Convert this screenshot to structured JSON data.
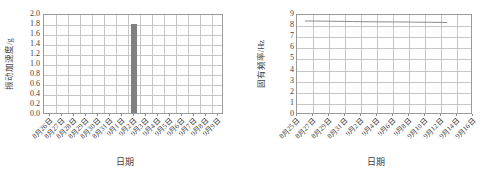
{
  "figure": {
    "background_color": "#ffffff",
    "text_color": "#3f3f3f",
    "grid_color": "#c6c6c6",
    "frame_color": "#9a9a9a"
  },
  "chart_data": [
    {
      "id": "vibration-acceleration-chart",
      "type": "bar",
      "title": "",
      "xlabel": "日期",
      "ylabel": "振动加速度/g",
      "categories": [
        "8月26日",
        "8月27日",
        "8月28日",
        "8月29日",
        "8月30日",
        "8月31日",
        "9月1日",
        "9月2日",
        "9月3日",
        "9月4日",
        "9月5日",
        "9月6日",
        "9月7日",
        "9月8日",
        "9月9日"
      ],
      "values": [
        0,
        0,
        0,
        0,
        0,
        0,
        0,
        1.79,
        0,
        0,
        0,
        0,
        0,
        0,
        0
      ],
      "ylim": [
        0.0,
        2.0
      ],
      "yticks": [
        "0.0",
        "0.2",
        "0.4",
        "0.6",
        "0.8",
        "1.0",
        "1.2",
        "1.4",
        "1.6",
        "1.8",
        "2.0"
      ],
      "ytick_values": [
        0.0,
        0.2,
        0.4,
        0.6,
        0.8,
        1.0,
        1.2,
        1.4,
        1.6,
        1.8,
        2.0
      ],
      "bar_color": "#808080",
      "grid": true,
      "legend": "none"
    },
    {
      "id": "natural-frequency-chart",
      "type": "line",
      "title": "",
      "xlabel": "日期",
      "ylabel": "固有频率/Hz",
      "categories": [
        "8月25日",
        "8月27日",
        "8月29日",
        "8月31日",
        "9月2日",
        "9月4日",
        "9月6日",
        "9月8日",
        "9月10日",
        "9月12日",
        "9月14日",
        "9月16日"
      ],
      "x": [
        0.5,
        1.5,
        2.5,
        3.5,
        4.5,
        5.5,
        6.5,
        7.5,
        8.5,
        9.5
      ],
      "values": [
        8.45,
        8.44,
        8.42,
        8.4,
        8.38,
        8.37,
        8.36,
        8.34,
        8.33,
        8.31
      ],
      "ylim": [
        0,
        9
      ],
      "yticks": [
        "0",
        "1",
        "2",
        "3",
        "4",
        "5",
        "6",
        "7",
        "8",
        "9"
      ],
      "ytick_values": [
        0,
        1,
        2,
        3,
        4,
        5,
        6,
        7,
        8,
        9
      ],
      "line_color": "#8c8c8c",
      "grid": true,
      "legend": "none"
    }
  ]
}
